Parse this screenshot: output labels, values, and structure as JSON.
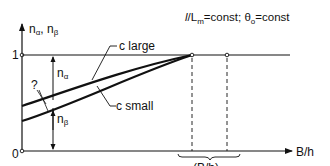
{
  "figure": {
    "title_parts": {
      "l": "l",
      "slash": "/L",
      "m_sub": "m",
      "eq1": "=const; θ",
      "o_sub": "o",
      "eq2": "=const"
    },
    "y_axis": {
      "label_n": "n",
      "label_alpha": "α",
      "label_sep": ", n",
      "label_beta": "β",
      "tick_one": "1",
      "tick_zero": "0"
    },
    "x_axis": {
      "label": "B/h"
    },
    "curves": [
      {
        "name": "c large",
        "label": "c large"
      },
      {
        "name": "c small",
        "label": "c small"
      }
    ],
    "annotations": {
      "n_alpha_n": "n",
      "n_alpha_sub": "α",
      "n_beta_n": "n",
      "n_beta_sub": "β",
      "question": "?",
      "brace_label": "(B/h)",
      "brace_sub": "*"
    }
  },
  "colors": {
    "ink": "#111111",
    "background": "#ffffff"
  }
}
